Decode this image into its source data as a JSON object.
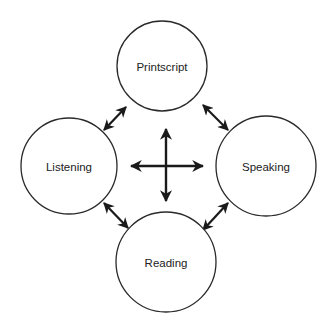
{
  "diagram": {
    "type": "cycle-network",
    "background": "#ffffff",
    "stroke_color": "#1a1a1a",
    "nodes": [
      {
        "id": "printscript",
        "label": "Printscript",
        "position": "top",
        "cx": 162,
        "cy": 66,
        "r": 45
      },
      {
        "id": "listening",
        "label": "Listening",
        "position": "left",
        "cx": 69,
        "cy": 166,
        "r": 48
      },
      {
        "id": "speaking",
        "label": "Speaking",
        "position": "right",
        "cx": 266,
        "cy": 166,
        "r": 50
      },
      {
        "id": "reading",
        "label": "Reading",
        "position": "bottom",
        "cx": 166,
        "cy": 262,
        "r": 50
      }
    ],
    "edges": [
      {
        "from": "printscript",
        "to": "listening",
        "direction": "bidirectional",
        "x1": 126,
        "y1": 107,
        "x2": 104,
        "y2": 130
      },
      {
        "from": "printscript",
        "to": "speaking",
        "direction": "bidirectional",
        "x1": 203,
        "y1": 105,
        "x2": 228,
        "y2": 130
      },
      {
        "from": "listening",
        "to": "reading",
        "direction": "bidirectional",
        "x1": 104,
        "y1": 203,
        "x2": 128,
        "y2": 228
      },
      {
        "from": "speaking",
        "to": "reading",
        "direction": "bidirectional",
        "x1": 228,
        "y1": 203,
        "x2": 203,
        "y2": 230
      }
    ],
    "center_symbol": {
      "type": "four-way-arrow",
      "cx": 166,
      "cy": 166,
      "vertical": {
        "y1": 129,
        "y2": 201
      },
      "horizontal": {
        "x1": 131,
        "x2": 203
      }
    }
  }
}
